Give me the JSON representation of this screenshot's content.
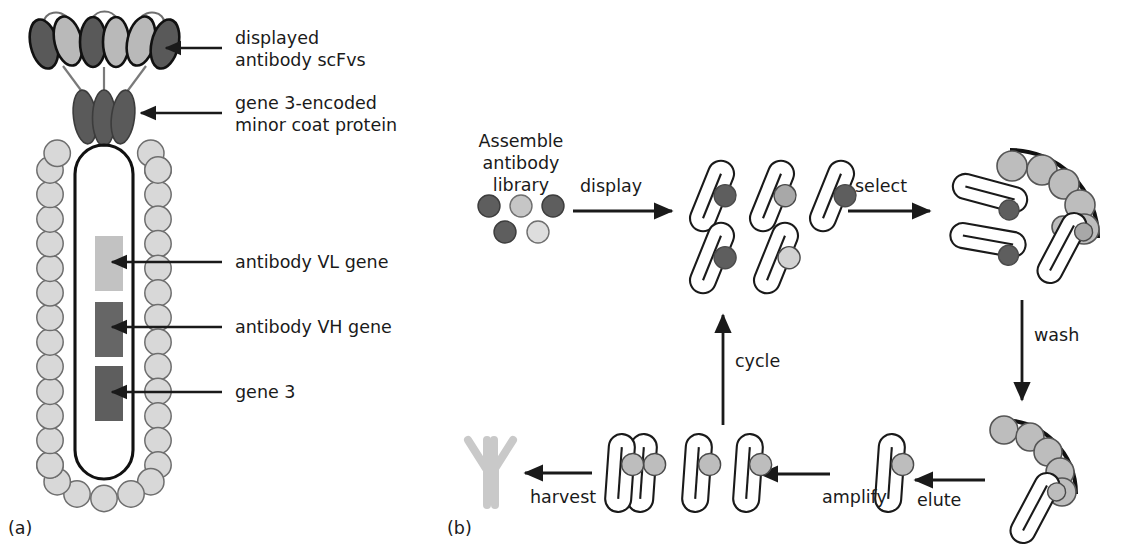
{
  "figure": {
    "type": "scientific-diagram",
    "panels": [
      {
        "id": "a",
        "label": "(a)",
        "name": "filamentous-phage-structure",
        "annotations": [
          {
            "key": "displayed_scfv",
            "text": "displayed\nantibody scFvs",
            "line1": "displayed",
            "line2": "antibody scFvs"
          },
          {
            "key": "coat_protein",
            "text": "gene 3-encoded\nminor coat protein",
            "line1": "gene 3-encoded",
            "line2": "minor coat protein"
          },
          {
            "key": "vl_gene",
            "text": "antibody VL gene",
            "line1": "antibody VL gene",
            "line2": ""
          },
          {
            "key": "vh_gene",
            "text": "antibody VH gene",
            "line1": "antibody VH gene",
            "line2": ""
          },
          {
            "key": "gene3",
            "text": "gene 3",
            "line1": "gene 3",
            "line2": ""
          }
        ]
      },
      {
        "id": "b",
        "label": "(b)",
        "name": "panning-cycle",
        "start_label": {
          "line1": "Assemble",
          "line2": "antibody",
          "line3": "library"
        },
        "steps": [
          {
            "key": "display",
            "label": "display",
            "direction": "right"
          },
          {
            "key": "select",
            "label": "select",
            "direction": "right"
          },
          {
            "key": "wash",
            "label": "wash",
            "direction": "down"
          },
          {
            "key": "elute",
            "label": "elute",
            "direction": "left"
          },
          {
            "key": "amplify",
            "label": "amplify",
            "direction": "left"
          },
          {
            "key": "harvest",
            "label": "harvest",
            "direction": "left"
          },
          {
            "key": "cycle",
            "label": "cycle",
            "direction": "up"
          }
        ]
      }
    ]
  },
  "colors": {
    "ink": "#1a1a1a",
    "capsid_fill": "#d8d8d8",
    "capsid_stroke": "#6e6e6e",
    "coat_protein_dark": "#5a5a5a",
    "scfv_dark": "#595959",
    "scfv_light": "#b9b9b9",
    "gene_vl": "#c2c2c2",
    "gene_vh": "#666666",
    "gene_g3": "#5e5e5e",
    "dot_dark": "#5e5e5e",
    "dot_mid": "#a8a8a8",
    "dot_light": "#d2d2d2",
    "antigen": "#bdbdbd",
    "antibody_y": "#c9c9c9"
  }
}
